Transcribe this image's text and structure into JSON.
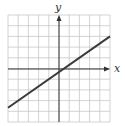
{
  "chart_data": {
    "type": "line",
    "title": "",
    "xlabel": "x",
    "ylabel": "y",
    "xlim": [
      -5,
      5
    ],
    "ylim": [
      -5,
      5
    ],
    "grid": true,
    "grid_step": 1,
    "tick_labels": false,
    "series": [
      {
        "name": "line",
        "equation": "y = (2/3)x - 1/3",
        "x": [
          -5,
          5
        ],
        "y": [
          -3.67,
          3.0
        ]
      }
    ]
  },
  "labels": {
    "x_axis": "x",
    "y_axis": "y"
  },
  "colors": {
    "grid": "#c8c8c8",
    "axis": "#333333",
    "line": "#3a3a3a"
  }
}
